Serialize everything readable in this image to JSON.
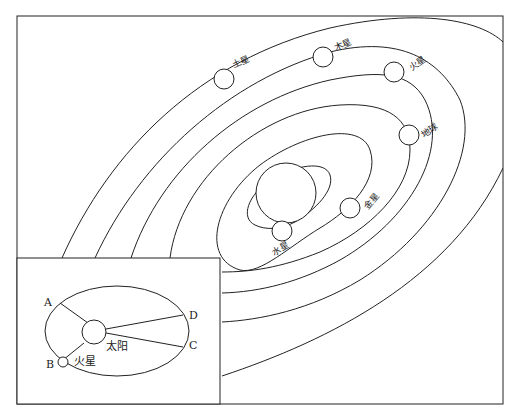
{
  "diagram": {
    "title": "",
    "frame": {
      "x": 17,
      "y": 16,
      "width": 486,
      "height": 388
    },
    "sun_main": {
      "label": ""
    },
    "planets": [
      {
        "name": "mercury",
        "label": "水星"
      },
      {
        "name": "venus",
        "label": "金星"
      },
      {
        "name": "earth",
        "label": "地球"
      },
      {
        "name": "mars",
        "label": "火星"
      },
      {
        "name": "jupiter",
        "label": "木星"
      },
      {
        "name": "saturn",
        "label": "土星"
      }
    ],
    "inset": {
      "sun_label": "太阳",
      "planet_label": "火星",
      "points": [
        {
          "id": "A",
          "label": "A"
        },
        {
          "id": "B",
          "label": "B"
        },
        {
          "id": "C",
          "label": "C"
        },
        {
          "id": "D",
          "label": "D"
        }
      ]
    }
  }
}
